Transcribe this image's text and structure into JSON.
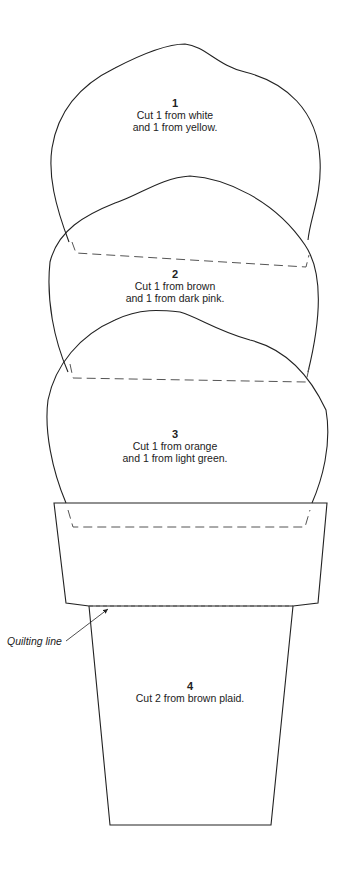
{
  "pieces": [
    {
      "number": "1",
      "line1": "Cut 1 from white",
      "line2": "and 1 from yellow."
    },
    {
      "number": "2",
      "line1": "Cut 1 from brown",
      "line2": "and 1 from dark pink."
    },
    {
      "number": "3",
      "line1": "Cut 1 from orange",
      "line2": "and 1 from light green."
    },
    {
      "number": "4",
      "line1": "Cut 2 from brown plaid.",
      "line2": ""
    }
  ],
  "callout": {
    "label": "Quilting line"
  },
  "colors": {
    "line": "#222222",
    "dash": "#555555",
    "background": "#ffffff"
  }
}
